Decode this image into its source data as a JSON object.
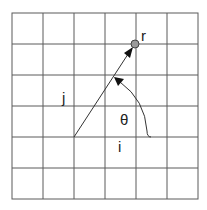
{
  "diagram": {
    "type": "polar-vector-on-grid",
    "grid": {
      "columns": 6,
      "rows": 6
    },
    "labels": {
      "point": "r",
      "vertical_axis": "j",
      "horizontal_axis": "i",
      "angle": "θ"
    },
    "colors": {
      "grid_line": "#555555",
      "vector": "#333333",
      "point_fill": "#9a9a9a",
      "background": "#ffffff"
    }
  }
}
